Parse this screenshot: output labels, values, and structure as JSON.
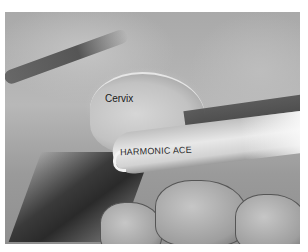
{
  "image": {
    "description": "Grayscale laparoscopic surgical photograph showing the cervix and a Harmonic ACE instrument shaft",
    "labels": {
      "cervix": "Cervix",
      "instrument": "HARMONIC ACE"
    }
  }
}
